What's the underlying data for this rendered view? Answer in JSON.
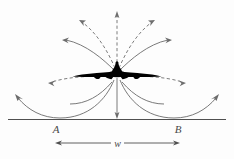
{
  "figure": {
    "background_color": "#fdfdfd",
    "line_color": "#6b6b6b",
    "aircraft_color": "#000000",
    "ground_color": "#555555",
    "labels": {
      "point_a": "A",
      "point_b": "B",
      "width": "w"
    },
    "elements": {
      "aircraft_name": "aircraft-silhouette",
      "ground_line_name": "ground-line",
      "dimension_name": "width-dimension-line"
    },
    "field_lines": {
      "solid_count": 7,
      "dashed_count": 6,
      "description": "radiating field lines from aircraft"
    },
    "geometry": {
      "aircraft_center_x": 117,
      "aircraft_center_y": 73,
      "ground_y": 119,
      "ground_x_start": 8,
      "ground_x_end": 226,
      "point_a_x": 56,
      "point_b_x": 178,
      "dimension_y": 142
    }
  }
}
